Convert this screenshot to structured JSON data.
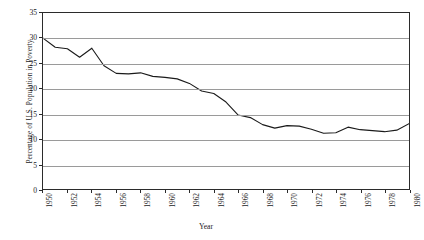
{
  "chart_data": {
    "type": "line",
    "title": "",
    "xlabel": "Year",
    "ylabel": "Percentage of U.S. Population in Poverty",
    "xlim": [
      1950,
      1980
    ],
    "ylim": [
      0,
      35
    ],
    "grid": true,
    "legend": "none",
    "line_color": "#1a1a1a",
    "y_ticks": [
      0,
      5,
      10,
      15,
      20,
      25,
      30,
      35
    ],
    "x_ticks": [
      1950,
      1952,
      1954,
      1956,
      1958,
      1960,
      1962,
      1964,
      1966,
      1968,
      1970,
      1972,
      1974,
      1976,
      1978,
      1980
    ],
    "x": [
      1950,
      1951,
      1952,
      1953,
      1954,
      1955,
      1956,
      1957,
      1958,
      1959,
      1960,
      1961,
      1962,
      1963,
      1964,
      1965,
      1966,
      1967,
      1968,
      1969,
      1970,
      1971,
      1972,
      1973,
      1974,
      1975,
      1976,
      1977,
      1978,
      1979,
      1980
    ],
    "values": [
      30.0,
      28.2,
      27.9,
      26.2,
      28.0,
      24.5,
      23.0,
      22.9,
      23.1,
      22.4,
      22.2,
      21.9,
      21.0,
      19.5,
      19.0,
      17.3,
      14.7,
      14.2,
      12.8,
      12.1,
      12.6,
      12.5,
      11.9,
      11.1,
      11.2,
      12.3,
      11.8,
      11.6,
      11.4,
      11.7,
      13.0
    ]
  }
}
